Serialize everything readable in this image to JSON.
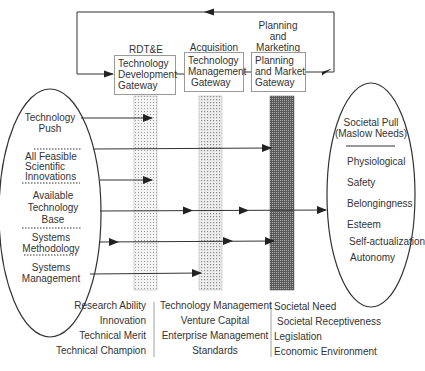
{
  "diagram": {
    "phases": [
      {
        "label": "RDT&E",
        "gateway": [
          "Technology",
          "Development",
          "Gateway"
        ]
      },
      {
        "label": "Acquisition",
        "gateway": [
          "Technology",
          "Management",
          "Gateway"
        ]
      },
      {
        "label_lines": [
          "Planning",
          "and",
          "Marketing"
        ],
        "gateway": [
          "Planning",
          "and Market",
          "Gateway"
        ]
      }
    ],
    "left_ellipse": {
      "items": [
        [
          "Technology",
          "Push"
        ],
        [
          "All Feasible",
          "Scientific",
          "Innovations"
        ],
        [
          "Available",
          "Technology",
          "Base"
        ],
        [
          "Systems",
          "Methodology"
        ],
        [
          "Systems",
          "Management"
        ]
      ]
    },
    "right_ellipse": {
      "title": [
        "Societal Pull",
        "(Maslow Needs)"
      ],
      "items": [
        "Physiological",
        "Safety",
        "Belongingness",
        "Esteem",
        "Self-actualization",
        "Autonomy"
      ]
    },
    "bottom_columns": [
      [
        "Research Ability",
        "Innovation",
        "Technical Merit",
        "Technical Champion"
      ],
      [
        "Technology Management",
        "Venture Capital",
        "Enterprise Management",
        "Standards"
      ],
      [
        "Societal Need",
        "Societal Receptiveness",
        "Legislation",
        "Economic Environment"
      ]
    ],
    "colors": {
      "line": "#333333",
      "light_fill": "#d9d9d9",
      "dark_fill": "#7a7a7a"
    }
  }
}
